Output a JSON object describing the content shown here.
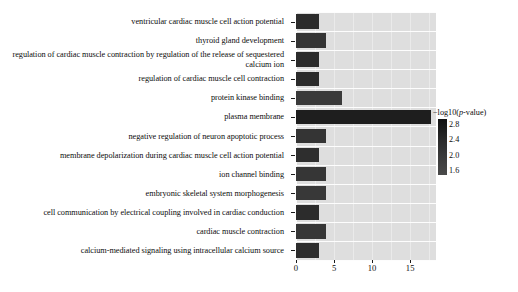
{
  "chart_data": {
    "type": "bar",
    "orientation": "horizontal",
    "title": "",
    "xlabel": "",
    "ylabel": "",
    "xlim": [
      0,
      18.4
    ],
    "xticks": [
      0,
      5,
      10,
      15
    ],
    "xtick_labels": [
      "0",
      "5",
      "10",
      "15"
    ],
    "grid": true,
    "grid_color": "#fdfdfd",
    "panel_background": "#dedede",
    "bar_color": "#303030",
    "legend_position": "right",
    "categories": [
      "ventricular cardiac muscle cell action potential",
      "thyroid gland development",
      "regulation of cardiac muscle contraction by regulation of the release of sequestered calcium ion",
      "regulation of cardiac muscle cell contraction",
      "protein kinase binding",
      "plasma membrane",
      "negative regulation of neuron apoptotic process",
      "membrane depolarization during cardiac muscle cell action potential",
      "ion channel binding",
      "embryonic skeletal system morphogenesis",
      "cell communication by electrical coupling involved in cardiac conduction",
      "cardiac muscle contraction",
      "calcium-mediated signaling using intracellular calcium source"
    ],
    "values": [
      3.0,
      4.0,
      3.0,
      3.0,
      6.0,
      17.8,
      4.0,
      3.0,
      4.0,
      4.0,
      3.0,
      4.0,
      3.0
    ],
    "colors": [
      "#2c2c2c",
      "#343434",
      "#2b2b2b",
      "#2b2b2b",
      "#3a3a3a",
      "#1e1e1e",
      "#343434",
      "#2e2e2e",
      "#363636",
      "#383838",
      "#2c2c2c",
      "#363636",
      "#2d2d2d"
    ],
    "colorbar": {
      "title_prefix": "−log10(",
      "title_italic": "p",
      "title_suffix": "-value)",
      "title_full": "−log10(p-value)",
      "ticks": [
        "2.8",
        "2.4",
        "2.0",
        "1.6"
      ],
      "gradient_top": "#111111",
      "gradient_bottom": "#4a4a4a"
    }
  }
}
